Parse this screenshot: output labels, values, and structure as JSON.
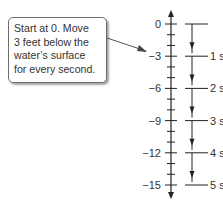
{
  "callout": {
    "lines": [
      "Start at 0. Move",
      "3 feet below the",
      "water’s surface",
      "for every second."
    ]
  },
  "number_line": {
    "labels": [
      "0",
      "−3",
      "−6",
      "−9",
      "−12",
      "−15"
    ],
    "values": [
      0,
      -3,
      -6,
      -9,
      -12,
      -15
    ],
    "time_labels": [
      "1 s",
      "2 s",
      "3 s",
      "4 s",
      "5 s"
    ]
  },
  "colors": {
    "line": "#222222",
    "text": "#333333",
    "border": "#6d6d6d"
  }
}
